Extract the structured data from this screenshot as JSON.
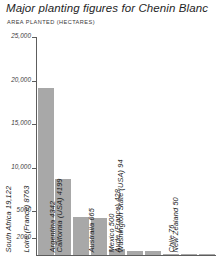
{
  "header": {
    "title": "Major planting figures for Chenin Blanc",
    "subtitle": "AREA PLANTED (HECTARES)"
  },
  "style": {
    "bar_color": "#a8a8a8",
    "axis_color": "#5d5d5d",
    "text_color": "#1c1c1c",
    "background": "#ffffff"
  },
  "chart_data": {
    "type": "bar",
    "title": "Major planting figures for Chenin Blanc",
    "subtitle": "AREA PLANTED (HECTARES)",
    "xlabel": "",
    "ylabel": "AREA PLANTED (HECTARES)",
    "ylim": [
      0,
      25000
    ],
    "grid": false,
    "legend": false,
    "orientation": "vertical",
    "ytick_labels": [
      "25,000",
      "20,000",
      "15,000",
      "10,000",
      "5000",
      "2000"
    ],
    "ytick_values": [
      25000,
      20000,
      15000,
      10000,
      5000,
      2000
    ],
    "categories": [
      "South Africa",
      "Loire (France)",
      "Argentina",
      "California (USA)",
      "Australia",
      "Mexico",
      "Aude (France)",
      "Washington State (USA)",
      "Chile",
      "New Zealand"
    ],
    "values": [
      19122,
      8763,
      4342,
      4199,
      665,
      500,
      428,
      94,
      76,
      50
    ],
    "bar_labels": [
      "South Africa 19,122",
      "Loire (France) 8763",
      "Argentina 4342",
      "California (USA) 4199",
      "Australia 665",
      "Mexico 500",
      "Aude (France) 428",
      "Washington State (USA) 94",
      "Chile 76",
      "New Zealand 50"
    ]
  }
}
